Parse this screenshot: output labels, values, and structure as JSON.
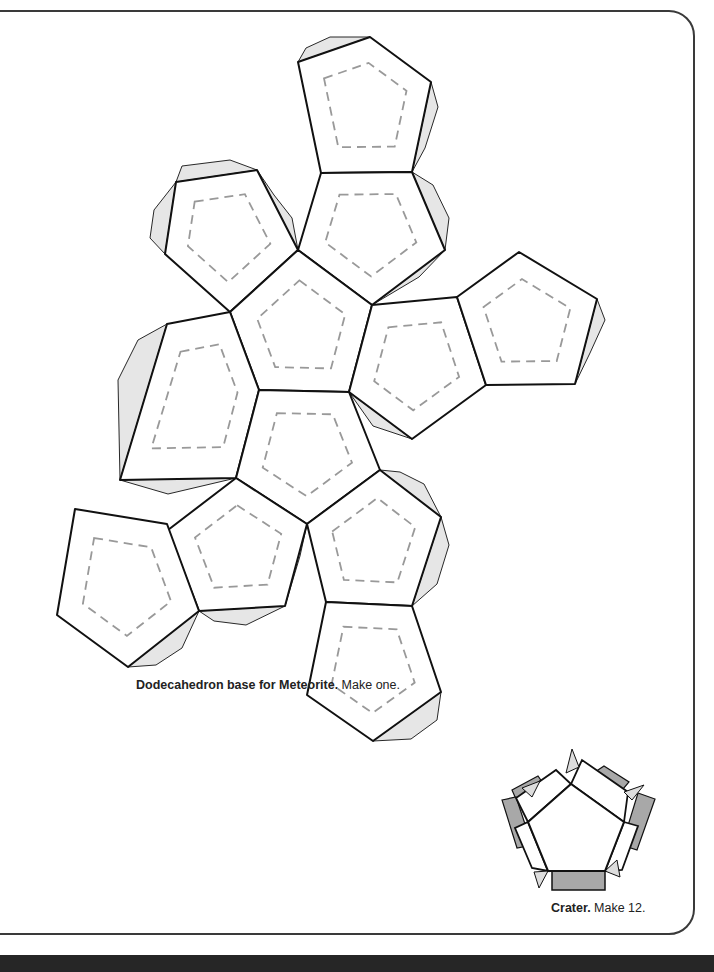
{
  "captions": {
    "base_bold": "Dodecahedron base for Meteorite.",
    "base_rest": " Make one.",
    "crater_bold": "Crater.",
    "crater_rest": " Make 12."
  },
  "colors": {
    "line": "#111111",
    "dash": "#999999",
    "tab_light": "#e6e6e6",
    "tab_dark": "#a8a8a8",
    "band": "#262626"
  },
  "net": {
    "faces": [
      [
        [
          298,
          62
        ],
        [
          370,
          37
        ],
        [
          431,
          82
        ],
        [
          412,
          172
        ],
        [
          321,
          173
        ]
      ],
      [
        [
          176,
          182
        ],
        [
          257,
          170
        ],
        [
          298,
          250
        ],
        [
          230,
          312
        ],
        [
          165,
          254
        ]
      ],
      [
        [
          321,
          173
        ],
        [
          412,
          172
        ],
        [
          445,
          250
        ],
        [
          372,
          305
        ],
        [
          298,
          250
        ]
      ],
      [
        [
          298,
          250
        ],
        [
          372,
          305
        ],
        [
          349,
          392
        ],
        [
          259,
          390
        ],
        [
          230,
          312
        ]
      ],
      [
        [
          372,
          305
        ],
        [
          457,
          297
        ],
        [
          486,
          385
        ],
        [
          412,
          439
        ],
        [
          349,
          392
        ]
      ],
      [
        [
          457,
          297
        ],
        [
          519,
          252
        ],
        [
          597,
          299
        ],
        [
          575,
          384
        ],
        [
          486,
          385
        ]
      ],
      [
        [
          167,
          324
        ],
        [
          230,
          312
        ],
        [
          259,
          390
        ],
        [
          236,
          478
        ],
        [
          120,
          480
        ]
      ],
      [
        [
          259,
          390
        ],
        [
          349,
          392
        ],
        [
          380,
          470
        ],
        [
          307,
          524
        ],
        [
          236,
          478
        ]
      ],
      [
        [
          236,
          478
        ],
        [
          307,
          524
        ],
        [
          285,
          606
        ],
        [
          199,
          611
        ],
        [
          168,
          530
        ]
      ],
      [
        [
          307,
          524
        ],
        [
          380,
          470
        ],
        [
          441,
          517
        ],
        [
          412,
          606
        ],
        [
          326,
          602
        ]
      ],
      [
        [
          75,
          509
        ],
        [
          167,
          524
        ],
        [
          199,
          611
        ],
        [
          128,
          667
        ],
        [
          57,
          615
        ]
      ],
      [
        [
          326,
          602
        ],
        [
          412,
          606
        ],
        [
          441,
          692
        ],
        [
          373,
          741
        ],
        [
          307,
          695
        ]
      ]
    ],
    "tabs": [
      [
        [
          298,
          62
        ],
        [
          370,
          37
        ],
        [
          330,
          37
        ],
        [
          306,
          48
        ]
      ],
      [
        [
          431,
          82
        ],
        [
          412,
          172
        ],
        [
          425,
          148
        ],
        [
          438,
          107
        ]
      ],
      [
        [
          176,
          182
        ],
        [
          257,
          170
        ],
        [
          230,
          160
        ],
        [
          182,
          166
        ]
      ],
      [
        [
          165,
          254
        ],
        [
          176,
          182
        ],
        [
          154,
          210
        ],
        [
          150,
          238
        ]
      ],
      [
        [
          257,
          170
        ],
        [
          298,
          250
        ],
        [
          292,
          218
        ],
        [
          274,
          195
        ]
      ],
      [
        [
          412,
          172
        ],
        [
          445,
          250
        ],
        [
          449,
          218
        ],
        [
          433,
          185
        ]
      ],
      [
        [
          298,
          250
        ],
        [
          230,
          312
        ],
        [
          242,
          280
        ],
        [
          278,
          258
        ]
      ],
      [
        [
          230,
          312
        ],
        [
          259,
          390
        ],
        [
          232,
          352
        ],
        [
          234,
          330
        ]
      ],
      [
        [
          372,
          305
        ],
        [
          445,
          250
        ],
        [
          419,
          277
        ]
      ],
      [
        [
          349,
          392
        ],
        [
          412,
          439
        ],
        [
          373,
          426
        ]
      ],
      [
        [
          597,
          299
        ],
        [
          575,
          384
        ],
        [
          590,
          353
        ],
        [
          605,
          320
        ]
      ],
      [
        [
          167,
          324
        ],
        [
          120,
          480
        ],
        [
          118,
          380
        ],
        [
          138,
          340
        ]
      ],
      [
        [
          120,
          480
        ],
        [
          236,
          478
        ],
        [
          168,
          494
        ]
      ],
      [
        [
          168,
          530
        ],
        [
          199,
          611
        ],
        [
          173,
          594
        ],
        [
          160,
          560
        ]
      ],
      [
        [
          199,
          611
        ],
        [
          285,
          606
        ],
        [
          246,
          625
        ],
        [
          214,
          621
        ]
      ],
      [
        [
          285,
          606
        ],
        [
          307,
          524
        ],
        [
          300,
          556
        ]
      ],
      [
        [
          380,
          470
        ],
        [
          441,
          517
        ],
        [
          424,
          484
        ],
        [
          400,
          472
        ]
      ],
      [
        [
          441,
          517
        ],
        [
          412,
          606
        ],
        [
          437,
          584
        ],
        [
          449,
          545
        ]
      ],
      [
        [
          128,
          667
        ],
        [
          199,
          611
        ],
        [
          182,
          648
        ],
        [
          156,
          665
        ]
      ],
      [
        [
          441,
          692
        ],
        [
          373,
          741
        ],
        [
          411,
          739
        ],
        [
          437,
          720
        ]
      ]
    ],
    "crater": {
      "pentagon": [
        [
          571,
          784
        ],
        [
          624,
          822
        ],
        [
          605,
          871
        ],
        [
          548,
          871
        ],
        [
          528,
          822
        ]
      ]
    }
  }
}
